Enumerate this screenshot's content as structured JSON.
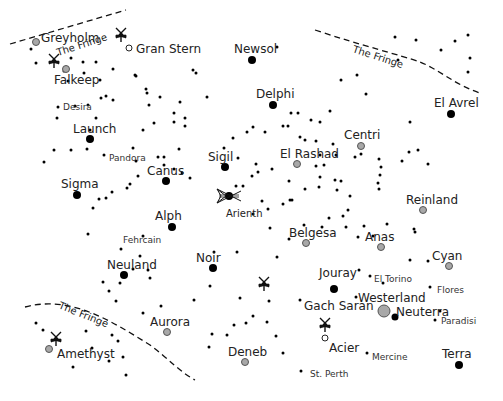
{
  "map": {
    "width": 503,
    "height": 401,
    "colors": {
      "background": "#ffffff",
      "star": "#000000",
      "system_black": "#000000",
      "system_grey": "#a8a8a8",
      "text": "#222222"
    },
    "fringe_label": "The Fringe",
    "fringe_borders": [
      {
        "name": "The Fringe",
        "path": "M10,44 L126,10",
        "label_x": 58,
        "label_y": 56,
        "label_rotate": -18
      },
      {
        "name": "The Fringe",
        "path": "M315,30 C360,45 400,55 420,62 C440,70 455,85 480,93",
        "label_x": 352,
        "label_y": 52,
        "label_rotate": 18
      },
      {
        "name": "The Fringe",
        "path": "M25,307 C70,295 110,320 150,345 C170,360 180,372 195,380",
        "label_x": 58,
        "label_y": 308,
        "label_rotate": 22
      }
    ],
    "systems": [
      {
        "name": "Greyholm",
        "type": "grey",
        "x": 36,
        "y": 42,
        "r": 3.5,
        "lx": 41,
        "ly": 42,
        "size": "major"
      },
      {
        "name": "Gran Stern",
        "type": "hollow",
        "x": 129,
        "y": 48,
        "r": 3,
        "lx": 136,
        "ly": 53,
        "size": "major"
      },
      {
        "name": "Falkeep",
        "type": "grey",
        "x": 66,
        "y": 69,
        "r": 3.5,
        "lx": 54,
        "ly": 84,
        "size": "major"
      },
      {
        "name": "Desira",
        "type": "star",
        "x": 58,
        "y": 107,
        "r": 1.5,
        "lx": 63,
        "ly": 110,
        "size": "minor"
      },
      {
        "name": "Newsol",
        "type": "black",
        "x": 252,
        "y": 60,
        "r": 4,
        "lx": 234,
        "ly": 53,
        "size": "major"
      },
      {
        "name": "Delphi",
        "type": "black",
        "x": 273,
        "y": 105,
        "r": 4,
        "lx": 256,
        "ly": 98,
        "size": "major"
      },
      {
        "name": "El Avrel",
        "type": "black",
        "x": 451,
        "y": 114,
        "r": 4,
        "lx": 434,
        "ly": 107,
        "size": "major"
      },
      {
        "name": "Launch",
        "type": "black",
        "x": 90,
        "y": 139,
        "r": 4,
        "lx": 73,
        "ly": 133,
        "size": "major"
      },
      {
        "name": "Pandora",
        "type": "star",
        "x": 104,
        "y": 155,
        "r": 1.5,
        "lx": 109,
        "ly": 161,
        "size": "minor"
      },
      {
        "name": "Centri",
        "type": "grey",
        "x": 361,
        "y": 146,
        "r": 3.5,
        "lx": 344,
        "ly": 139,
        "size": "major"
      },
      {
        "name": "Sigil",
        "type": "black",
        "x": 225,
        "y": 167,
        "r": 4,
        "lx": 208,
        "ly": 161,
        "size": "major"
      },
      {
        "name": "El Rashad",
        "type": "grey",
        "x": 297,
        "y": 164,
        "r": 3.5,
        "lx": 280,
        "ly": 158,
        "size": "major"
      },
      {
        "name": "Canus",
        "type": "black",
        "x": 166,
        "y": 181,
        "r": 4,
        "lx": 147,
        "ly": 175,
        "size": "major"
      },
      {
        "name": "Sigma",
        "type": "black",
        "x": 77,
        "y": 195,
        "r": 4,
        "lx": 61,
        "ly": 188,
        "size": "major"
      },
      {
        "name": "Arienth",
        "type": "black",
        "x": 229,
        "y": 196,
        "r": 4,
        "lx": 226,
        "ly": 217,
        "size": "minor_large",
        "icon": "fleet"
      },
      {
        "name": "Reinland",
        "type": "grey",
        "x": 423,
        "y": 210,
        "r": 3.5,
        "lx": 406,
        "ly": 204,
        "size": "major"
      },
      {
        "name": "Alph",
        "type": "black",
        "x": 172,
        "y": 227,
        "r": 4,
        "lx": 155,
        "ly": 220,
        "size": "major"
      },
      {
        "name": "Belgesa",
        "type": "grey",
        "x": 306,
        "y": 243,
        "r": 3.5,
        "lx": 289,
        "ly": 237,
        "size": "major"
      },
      {
        "name": "Fehrcain",
        "type": "star",
        "x": 121,
        "y": 249,
        "r": 1.5,
        "lx": 123,
        "ly": 243,
        "size": "minor"
      },
      {
        "name": "Anas",
        "type": "grey",
        "x": 381,
        "y": 247,
        "r": 3.5,
        "lx": 365,
        "ly": 241,
        "size": "major"
      },
      {
        "name": "Neuland",
        "type": "black",
        "x": 124,
        "y": 275,
        "r": 4,
        "lx": 107,
        "ly": 269,
        "size": "major"
      },
      {
        "name": "Noir",
        "type": "black",
        "x": 213,
        "y": 268,
        "r": 4,
        "lx": 196,
        "ly": 262,
        "size": "major"
      },
      {
        "name": "Cyan",
        "type": "grey",
        "x": 449,
        "y": 266,
        "r": 3.5,
        "lx": 432,
        "ly": 260,
        "size": "major"
      },
      {
        "name": "Jouray",
        "type": "black",
        "x": 334,
        "y": 289,
        "r": 4,
        "lx": 319,
        "ly": 277,
        "size": "major"
      },
      {
        "name": "El Torino",
        "type": "star",
        "x": 370,
        "y": 276,
        "r": 1.5,
        "lx": 374,
        "ly": 282,
        "size": "minor"
      },
      {
        "name": "Flores",
        "type": "star",
        "x": 430,
        "y": 287,
        "r": 1.5,
        "lx": 437,
        "ly": 293,
        "size": "minor"
      },
      {
        "name": "Westerland",
        "type": "star",
        "x": 356,
        "y": 297,
        "r": 1.5,
        "lx": 358,
        "ly": 302,
        "size": "major"
      },
      {
        "name": "Gach Saran",
        "type": "star",
        "x": 300,
        "y": 300,
        "r": 1.5,
        "lx": 304,
        "ly": 310,
        "size": "major"
      },
      {
        "name": "Neuterra",
        "type": "black",
        "x": 395,
        "y": 317,
        "r": 3.5,
        "lx": 396,
        "ly": 316,
        "size": "major"
      },
      {
        "name": "Neuterra-grey",
        "type": "grey",
        "x": 384,
        "y": 311,
        "r": 6,
        "lx": null,
        "ly": null,
        "size": "none"
      },
      {
        "name": "Paradisi",
        "type": "star",
        "x": 435,
        "y": 320,
        "r": 1.5,
        "lx": 441,
        "ly": 324,
        "size": "minor"
      },
      {
        "name": "Aurora",
        "type": "grey",
        "x": 167,
        "y": 332,
        "r": 3.5,
        "lx": 150,
        "ly": 326,
        "size": "major"
      },
      {
        "name": "Acier",
        "type": "hollow",
        "x": 325,
        "y": 338,
        "r": 3,
        "lx": 329,
        "ly": 352,
        "size": "major"
      },
      {
        "name": "Amethyst",
        "type": "grey",
        "x": 49,
        "y": 349,
        "r": 3.5,
        "lx": 57,
        "ly": 358,
        "size": "major"
      },
      {
        "name": "Deneb",
        "type": "grey",
        "x": 245,
        "y": 362,
        "r": 3.5,
        "lx": 228,
        "ly": 356,
        "size": "major"
      },
      {
        "name": "Mercine",
        "type": "star",
        "x": 367,
        "y": 353,
        "r": 1.5,
        "lx": 372,
        "ly": 360,
        "size": "minor"
      },
      {
        "name": "Terra",
        "type": "black",
        "x": 459,
        "y": 365,
        "r": 4,
        "lx": 442,
        "ly": 358,
        "size": "major"
      },
      {
        "name": "St. Perth",
        "type": "star",
        "x": 301,
        "y": 371,
        "r": 1.5,
        "lx": 310,
        "ly": 377,
        "size": "minor"
      }
    ],
    "fleet_markers": [
      {
        "name": "fleet-near-gran-stern",
        "x": 121,
        "y": 34
      },
      {
        "name": "fleet-near-falkeep",
        "x": 54,
        "y": 60
      },
      {
        "name": "fleet-near-noir",
        "x": 264,
        "y": 283
      },
      {
        "name": "fleet-near-acier",
        "x": 325,
        "y": 324
      },
      {
        "name": "fleet-near-amethyst",
        "x": 56,
        "y": 338
      }
    ],
    "stars": [
      [
        31,
        49
      ],
      [
        83,
        62
      ],
      [
        96,
        62
      ],
      [
        113,
        69
      ],
      [
        68,
        81
      ],
      [
        100,
        80
      ],
      [
        136,
        76
      ],
      [
        146,
        89
      ],
      [
        160,
        97
      ],
      [
        101,
        98
      ],
      [
        113,
        100
      ],
      [
        149,
        105
      ],
      [
        174,
        113
      ],
      [
        180,
        102
      ],
      [
        207,
        97
      ],
      [
        277,
        47
      ],
      [
        193,
        70
      ],
      [
        196,
        73
      ],
      [
        174,
        122
      ],
      [
        185,
        118
      ],
      [
        185,
        126
      ],
      [
        179,
        149
      ],
      [
        147,
        93
      ],
      [
        135,
        75
      ],
      [
        106,
        96
      ],
      [
        88,
        105
      ],
      [
        84,
        73
      ],
      [
        64,
        71
      ],
      [
        36,
        63
      ],
      [
        71,
        58
      ],
      [
        75,
        106
      ],
      [
        57,
        118
      ],
      [
        87,
        149
      ],
      [
        96,
        118
      ],
      [
        90,
        130
      ],
      [
        143,
        130
      ],
      [
        154,
        123
      ],
      [
        158,
        157
      ],
      [
        174,
        169
      ],
      [
        182,
        173
      ],
      [
        190,
        178
      ],
      [
        71,
        150
      ],
      [
        54,
        150
      ],
      [
        44,
        162
      ],
      [
        133,
        148
      ],
      [
        136,
        161
      ],
      [
        164,
        165
      ],
      [
        164,
        157
      ],
      [
        138,
        176
      ],
      [
        130,
        184
      ],
      [
        127,
        188
      ],
      [
        112,
        192
      ],
      [
        99,
        199
      ],
      [
        106,
        198
      ],
      [
        93,
        208
      ],
      [
        88,
        234
      ],
      [
        143,
        236
      ],
      [
        140,
        256
      ],
      [
        133,
        269
      ],
      [
        120,
        283
      ],
      [
        103,
        282
      ],
      [
        109,
        291
      ],
      [
        148,
        270
      ],
      [
        150,
        278
      ],
      [
        161,
        306
      ],
      [
        194,
        300
      ],
      [
        210,
        286
      ],
      [
        240,
        298
      ],
      [
        269,
        301
      ],
      [
        277,
        257
      ],
      [
        214,
        252
      ],
      [
        237,
        252
      ],
      [
        233,
        138
      ],
      [
        247,
        132
      ],
      [
        253,
        127
      ],
      [
        265,
        132
      ],
      [
        283,
        126
      ],
      [
        291,
        113
      ],
      [
        298,
        113
      ],
      [
        311,
        120
      ],
      [
        320,
        122
      ],
      [
        333,
        144
      ],
      [
        300,
        137
      ],
      [
        305,
        140
      ],
      [
        316,
        141
      ],
      [
        320,
        155
      ],
      [
        336,
        155
      ],
      [
        324,
        165
      ],
      [
        272,
        169
      ],
      [
        236,
        186
      ],
      [
        243,
        186
      ],
      [
        262,
        201
      ],
      [
        268,
        209
      ],
      [
        283,
        204
      ],
      [
        292,
        200
      ],
      [
        305,
        189
      ],
      [
        320,
        177
      ],
      [
        335,
        180
      ],
      [
        341,
        181
      ],
      [
        355,
        157
      ],
      [
        361,
        154
      ],
      [
        379,
        159
      ],
      [
        381,
        167
      ],
      [
        380,
        175
      ],
      [
        378,
        183
      ],
      [
        379,
        189
      ],
      [
        402,
        161
      ],
      [
        409,
        152
      ],
      [
        418,
        150
      ],
      [
        428,
        164
      ],
      [
        395,
        37
      ],
      [
        398,
        60
      ],
      [
        416,
        40
      ],
      [
        441,
        50
      ],
      [
        455,
        41
      ],
      [
        468,
        35
      ],
      [
        470,
        58
      ],
      [
        468,
        72
      ],
      [
        357,
        75
      ],
      [
        341,
        80
      ],
      [
        330,
        111
      ],
      [
        366,
        94
      ],
      [
        410,
        122
      ],
      [
        288,
        126
      ],
      [
        270,
        228
      ],
      [
        322,
        227
      ],
      [
        329,
        218
      ],
      [
        343,
        216
      ],
      [
        348,
        210
      ],
      [
        350,
        196
      ],
      [
        337,
        190
      ],
      [
        319,
        187
      ],
      [
        316,
        166
      ],
      [
        224,
        148
      ],
      [
        238,
        158
      ],
      [
        256,
        164
      ],
      [
        258,
        172
      ],
      [
        252,
        176
      ],
      [
        289,
        181
      ],
      [
        290,
        200
      ],
      [
        253,
        214
      ],
      [
        289,
        239
      ],
      [
        304,
        225
      ],
      [
        358,
        237
      ],
      [
        373,
        236
      ],
      [
        346,
        227
      ],
      [
        364,
        226
      ],
      [
        387,
        224
      ],
      [
        415,
        232
      ],
      [
        414,
        229
      ],
      [
        359,
        270
      ],
      [
        383,
        283
      ],
      [
        428,
        261
      ],
      [
        410,
        260
      ],
      [
        440,
        311
      ],
      [
        227,
        335
      ],
      [
        234,
        325
      ],
      [
        246,
        323
      ],
      [
        253,
        316
      ],
      [
        267,
        322
      ],
      [
        276,
        336
      ],
      [
        283,
        353
      ],
      [
        209,
        347
      ],
      [
        212,
        334
      ],
      [
        123,
        357
      ],
      [
        118,
        341
      ],
      [
        112,
        335
      ],
      [
        92,
        348
      ],
      [
        73,
        367
      ],
      [
        109,
        361
      ],
      [
        126,
        375
      ],
      [
        36,
        323
      ],
      [
        43,
        330
      ],
      [
        86,
        331
      ],
      [
        116,
        301
      ],
      [
        143,
        313
      ]
    ]
  }
}
